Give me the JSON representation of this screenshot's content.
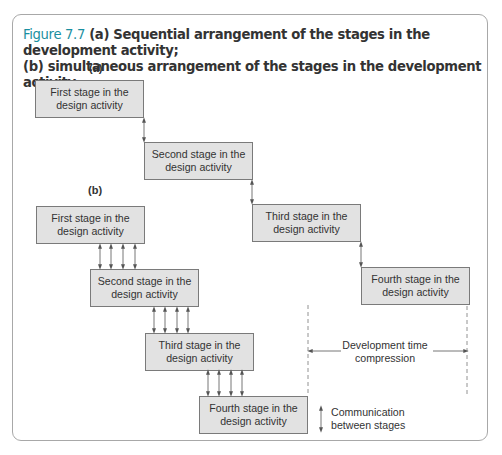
{
  "caption": {
    "figure_number": "Figure 7.7",
    "line1": " (a) Sequential arrangement of the stages in the development activity;",
    "line2": "(b) simultaneous arrangement of the stages in the development activity"
  },
  "panel_a": {
    "label": "(a)",
    "stages": [
      {
        "line1": "First stage in the",
        "line2": "design activity"
      },
      {
        "line1": "Second stage in the",
        "line2": "design activity"
      },
      {
        "line1": "Third stage in the",
        "line2": "design activity"
      },
      {
        "line1": "Fourth stage in the",
        "line2": "design activity"
      }
    ]
  },
  "panel_b": {
    "label": "(b)",
    "stages": [
      {
        "line1": "First stage in the",
        "line2": "design activity"
      },
      {
        "line1": "Second stage in the",
        "line2": "design activity"
      },
      {
        "line1": "Third stage in the",
        "line2": "design activity"
      },
      {
        "line1": "Fourth stage in the",
        "line2": "design activity"
      }
    ]
  },
  "compression": {
    "line1": "Development time",
    "line2": "compression"
  },
  "legend": {
    "icon": "double-arrow-icon",
    "line1": "Communication",
    "line2": "between stages"
  },
  "colors": {
    "figure_number": "#1a8fa0",
    "box_fill": "#e2e2e2",
    "frame": "#a8a8a8"
  }
}
